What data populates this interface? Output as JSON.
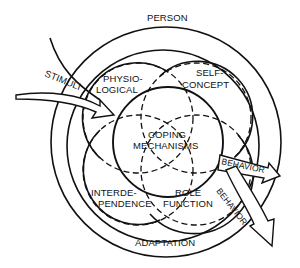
{
  "diagram": {
    "outer_label": "PERSON",
    "band_label": "ADAPTATION",
    "center_label": {
      "line1": "COPING",
      "line2": "MECHANISMS"
    },
    "input_label": "STIMULI",
    "modes": {
      "physiological": {
        "line1": "PHYSIO-",
        "line2": "LOGICAL"
      },
      "self_concept": {
        "line1": "SELF-",
        "line2": "CONCEPT"
      },
      "interdependence": {
        "line1": "INTERDE-",
        "line2": "PENDENCE"
      },
      "role_function": {
        "line1": "ROLE",
        "line2": "FUNCTION"
      }
    },
    "outputs": [
      {
        "label": "BEHAVIOR"
      },
      {
        "label": "BEHAVIOR"
      }
    ],
    "colors": {
      "stroke": "#111111",
      "background": "#ffffff"
    }
  }
}
